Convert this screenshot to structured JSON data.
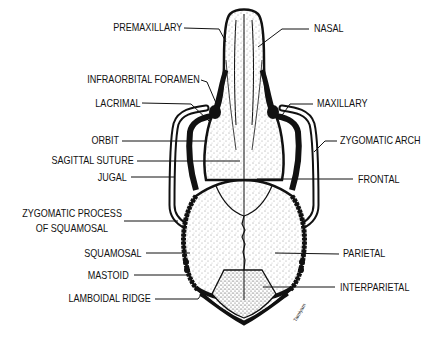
{
  "diagram": {
    "labels_left": [
      {
        "id": "premaxillary",
        "text": "PREMAXILLARY"
      },
      {
        "id": "infraorbital-foramen",
        "text": "INFRAORBITAL FORAMEN"
      },
      {
        "id": "lacrimal",
        "text": "LACRIMAL"
      },
      {
        "id": "orbit",
        "text": "ORBIT"
      },
      {
        "id": "sagittal-suture",
        "text": "SAGITTAL SUTURE"
      },
      {
        "id": "jugal",
        "text": "JUGAL"
      },
      {
        "id": "zygomatic-process",
        "text_line1": "ZYGOMATIC PROCESS",
        "text_line2": "OF SQUAMOSAL"
      },
      {
        "id": "squamosal",
        "text": "SQUAMOSAL"
      },
      {
        "id": "mastoid",
        "text": "MASTOID"
      },
      {
        "id": "lamboidal-ridge",
        "text": "LAMBOIDAL RIDGE"
      }
    ],
    "labels_right": [
      {
        "id": "nasal",
        "text": "NASAL"
      },
      {
        "id": "maxillary",
        "text": "MAXILLARY"
      },
      {
        "id": "zygomatic-arch",
        "text": "ZYGOMATIC ARCH"
      },
      {
        "id": "frontal",
        "text": "FRONTAL"
      },
      {
        "id": "parietal",
        "text": "PARIETAL"
      },
      {
        "id": "interparietal",
        "text": "INTERPARIETAL"
      }
    ],
    "signature": "Tamiyam",
    "colors": {
      "ink": "#111111",
      "background": "#ffffff",
      "stipple": "#333333"
    }
  }
}
